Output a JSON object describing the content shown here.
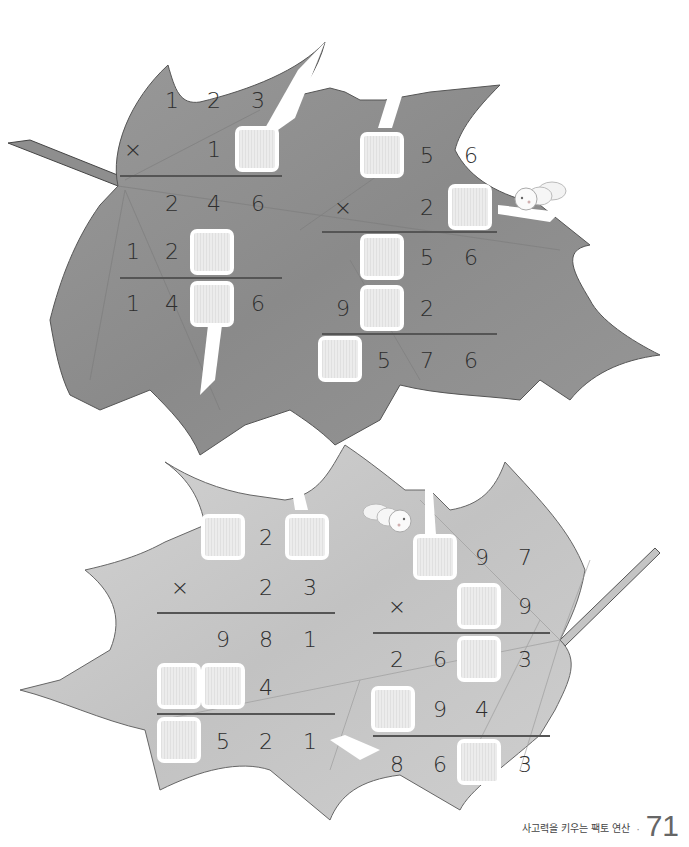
{
  "page": {
    "footer_title": "사고력을 키우는 팩토 연산",
    "page_number": "71",
    "leaf_colors": {
      "top_leaf": "#8f8f8f",
      "bottom_leaf": "#c9c9c9"
    }
  },
  "problems": [
    {
      "id": "p1",
      "multiplicand": [
        "1",
        "2",
        "3"
      ],
      "operator": "×",
      "multiplier": [
        "1",
        "□"
      ],
      "partial_1": [
        "2",
        "4",
        "6"
      ],
      "partial_2": [
        "1",
        "2",
        "□"
      ],
      "result": [
        "1",
        "4",
        "□",
        "6"
      ]
    },
    {
      "id": "p2",
      "multiplicand": [
        "□",
        "5",
        "6"
      ],
      "operator": "×",
      "multiplier": [
        "2",
        "□"
      ],
      "partial_1": [
        "□",
        "5",
        "6"
      ],
      "partial_2": [
        "9",
        "□",
        "2"
      ],
      "result": [
        "□",
        "5",
        "7",
        "6"
      ]
    },
    {
      "id": "p3",
      "multiplicand": [
        "□",
        "2",
        "□"
      ],
      "operator": "×",
      "multiplier": [
        "2",
        "3"
      ],
      "partial_1": [
        "9",
        "8",
        "1"
      ],
      "partial_2": [
        "□",
        "□",
        "4"
      ],
      "result": [
        "□",
        "5",
        "2",
        "1"
      ]
    },
    {
      "id": "p4",
      "multiplicand": [
        "□",
        "9",
        "7"
      ],
      "operator": "×",
      "multiplier": [
        "□",
        "9"
      ],
      "partial_1": [
        "2",
        "6",
        "□",
        "3"
      ],
      "partial_2": [
        "□",
        "9",
        "4"
      ],
      "result": [
        "8",
        "6",
        "□",
        "3"
      ]
    }
  ],
  "labels": {
    "p1_r1_c1": "1",
    "p1_r1_c2": "2",
    "p1_r1_c3": "3",
    "p1_op": "×",
    "p1_r2_c2": "1",
    "p1_r3_c1": "2",
    "p1_r3_c2": "4",
    "p1_r3_c3": "6",
    "p1_r4_c0": "1",
    "p1_r4_c1": "2",
    "p1_r5_c0": "1",
    "p1_r5_c1": "4",
    "p1_r5_c3": "6",
    "p2_r1_c2": "5",
    "p2_r1_c3": "6",
    "p2_op": "×",
    "p2_r2_c2": "2",
    "p2_r3_c2": "5",
    "p2_r3_c3": "6",
    "p2_r4_c0": "9",
    "p2_r4_c2": "2",
    "p2_r5_c1": "5",
    "p2_r5_c2": "7",
    "p2_r5_c3": "6",
    "p3_r1_c2": "2",
    "p3_op": "×",
    "p3_r2_c2": "2",
    "p3_r2_c3": "3",
    "p3_r3_c1": "9",
    "p3_r3_c2": "8",
    "p3_r3_c3": "1",
    "p3_r4_c2": "4",
    "p3_r5_c1": "5",
    "p3_r5_c2": "2",
    "p3_r5_c3": "1",
    "p4_r1_c2": "9",
    "p4_r1_c3": "7",
    "p4_op": "×",
    "p4_r2_c3": "9",
    "p4_r3_c0": "2",
    "p4_r3_c1": "6",
    "p4_r3_c3": "3",
    "p4_r4_c1": "9",
    "p4_r4_c2": "4",
    "p4_r5_c0": "8",
    "p4_r5_c1": "6",
    "p4_r5_c3": "3"
  }
}
